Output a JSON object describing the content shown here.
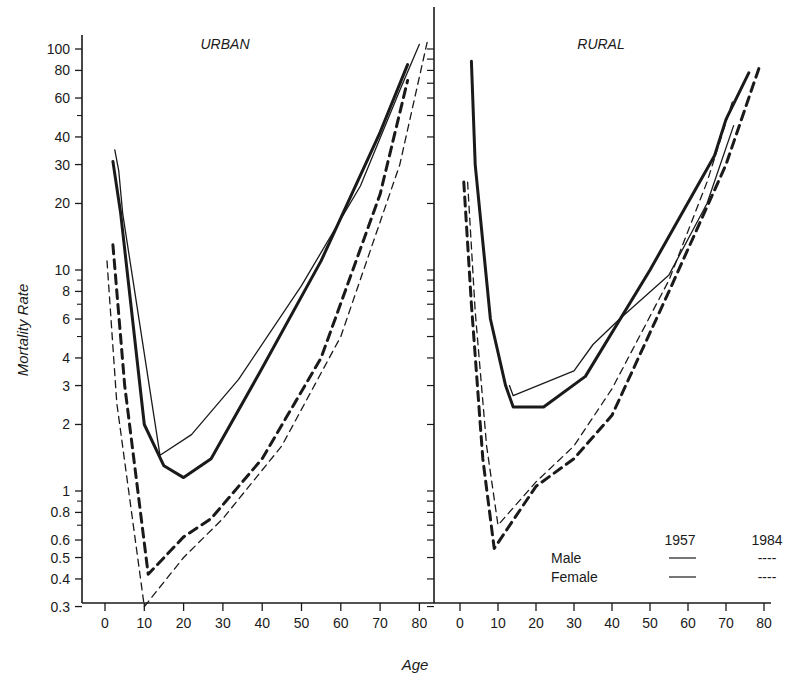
{
  "chart_data": [
    {
      "type": "line",
      "title": "URBAN",
      "xlabel": "Age",
      "ylabel": "Mortality Rate",
      "yscale": "log",
      "ylim": [
        0.3,
        110
      ],
      "xlim": [
        0,
        82
      ],
      "x_ticks": [
        0,
        10,
        20,
        30,
        40,
        50,
        60,
        70,
        80
      ],
      "y_tick_labels": [
        "100",
        "80",
        "60",
        "40",
        "30",
        "20",
        "10",
        "8",
        "6",
        "4",
        "3",
        "2",
        "1",
        "0.8",
        "0.6",
        "0.5",
        "0.4",
        "0.3"
      ],
      "series": [
        {
          "name": "Male 1957",
          "style": "solid-thick",
          "x": [
            2,
            4,
            10,
            15,
            20,
            27,
            40,
            55,
            70,
            77
          ],
          "y": [
            31,
            18,
            2.0,
            1.3,
            1.15,
            1.4,
            3.6,
            11,
            42,
            85
          ]
        },
        {
          "name": "Female 1957",
          "style": "solid-thin",
          "x": [
            2.5,
            3.5,
            4.5,
            14,
            22,
            34,
            50,
            65,
            75,
            80
          ],
          "y": [
            35,
            28,
            18,
            1.45,
            1.8,
            3.2,
            8.5,
            24,
            65,
            105
          ]
        },
        {
          "name": "Male 1984",
          "style": "dashed-thick",
          "x": [
            2,
            5,
            11,
            20,
            27,
            40,
            55,
            70,
            77
          ],
          "y": [
            13,
            3.0,
            0.42,
            0.62,
            0.75,
            1.4,
            4.0,
            22,
            72
          ]
        },
        {
          "name": "Female 1984",
          "style": "dashed-thin",
          "x": [
            0.5,
            3,
            10,
            20,
            30,
            45,
            60,
            75,
            82
          ],
          "y": [
            11,
            2.5,
            0.3,
            0.5,
            0.75,
            1.6,
            5.0,
            30,
            108
          ]
        }
      ]
    },
    {
      "type": "line",
      "title": "RURAL",
      "xlabel": "Age",
      "ylabel": "Mortality Rate",
      "yscale": "log",
      "ylim": [
        0.3,
        110
      ],
      "xlim": [
        0,
        82
      ],
      "x_ticks": [
        0,
        10,
        20,
        30,
        40,
        50,
        60,
        70,
        80
      ],
      "series": [
        {
          "name": "Male 1957",
          "style": "solid-thick",
          "x": [
            3,
            4,
            8,
            12,
            14,
            22,
            33,
            50,
            67,
            70,
            76
          ],
          "y": [
            88,
            30,
            6.0,
            3.0,
            2.4,
            2.4,
            3.3,
            10,
            33,
            48,
            78
          ]
        },
        {
          "name": "Female 1957",
          "style": "solid-thin",
          "x": [
            13,
            14,
            30,
            35,
            42,
            55,
            65,
            72
          ],
          "y": [
            3.0,
            2.7,
            3.5,
            4.6,
            6.0,
            9.5,
            20,
            45
          ]
        },
        {
          "name": "Male 1984",
          "style": "dashed-thick",
          "x": [
            1,
            3,
            6,
            9,
            20,
            30,
            40,
            55,
            70,
            79
          ],
          "y": [
            25,
            7.0,
            1.4,
            0.55,
            1.05,
            1.4,
            2.2,
            8,
            30,
            85
          ]
        },
        {
          "name": "Female 1984",
          "style": "dashed-thin",
          "x": [
            2,
            4,
            7,
            10,
            20,
            30,
            40,
            55,
            65,
            72
          ],
          "y": [
            25,
            6.5,
            1.6,
            0.7,
            1.1,
            1.6,
            2.9,
            9,
            25,
            60
          ]
        }
      ]
    }
  ],
  "panels": {
    "urban_title": "URBAN",
    "rural_title": "RURAL"
  },
  "axes": {
    "y_title": "Mortality Rate",
    "x_title": "Age",
    "y_ticks": [
      {
        "label": "100",
        "v": 100
      },
      {
        "label": "80",
        "v": 80
      },
      {
        "label": "60",
        "v": 60
      },
      {
        "label": "40",
        "v": 40
      },
      {
        "label": "30",
        "v": 30
      },
      {
        "label": "20",
        "v": 20
      },
      {
        "label": "10",
        "v": 10
      },
      {
        "label": "8",
        "v": 8
      },
      {
        "label": "6",
        "v": 6
      },
      {
        "label": "4",
        "v": 4
      },
      {
        "label": "3",
        "v": 3
      },
      {
        "label": "2",
        "v": 2
      },
      {
        "label": "1",
        "v": 1
      },
      {
        "label": "0.8",
        "v": 0.8
      },
      {
        "label": "0.6",
        "v": 0.6
      },
      {
        "label": "0.5",
        "v": 0.5
      },
      {
        "label": "0.4",
        "v": 0.4
      },
      {
        "label": "0.3",
        "v": 0.3
      }
    ],
    "x_tick_labels": [
      "0",
      "10",
      "20",
      "30",
      "40",
      "50",
      "60",
      "70",
      "80"
    ]
  },
  "legend": {
    "col_1957": "1957",
    "col_1984": "1984",
    "row_male": "Male",
    "row_female": "Female",
    "dash_symbol": "----"
  }
}
